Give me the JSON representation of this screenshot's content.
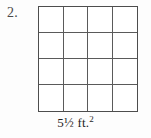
{
  "figure": {
    "problem_number": "2.",
    "caption": {
      "measure": "5½ ft.",
      "exponent": "2",
      "full_text": "5½ ft.2"
    },
    "grid": {
      "columns": 4,
      "rows": 4,
      "total_cells": 16,
      "cells": [
        {
          "row": 1,
          "col": 1,
          "label": ""
        },
        {
          "row": 1,
          "col": 2,
          "label": ""
        },
        {
          "row": 1,
          "col": 3,
          "label": ""
        },
        {
          "row": 1,
          "col": 4,
          "label": ""
        },
        {
          "row": 2,
          "col": 1,
          "label": ""
        },
        {
          "row": 2,
          "col": 2,
          "label": ""
        },
        {
          "row": 2,
          "col": 3,
          "label": ""
        },
        {
          "row": 2,
          "col": 4,
          "label": ""
        },
        {
          "row": 3,
          "col": 1,
          "label": ""
        },
        {
          "row": 3,
          "col": 2,
          "label": ""
        },
        {
          "row": 3,
          "col": 3,
          "label": ""
        },
        {
          "row": 3,
          "col": 4,
          "label": ""
        },
        {
          "row": 4,
          "col": 1,
          "label": ""
        },
        {
          "row": 4,
          "col": 2,
          "label": ""
        },
        {
          "row": 4,
          "col": 3,
          "label": ""
        },
        {
          "row": 4,
          "col": 4,
          "label": ""
        }
      ]
    },
    "colors": {
      "page_background": "#fdfdfd",
      "grid_background": "#ffffff",
      "grid_outer_line": "#4d4d4d",
      "grid_inner_line": "#5a5a5a",
      "number_text": "#4a4a4a",
      "caption_text": "#1f1f1f"
    }
  }
}
